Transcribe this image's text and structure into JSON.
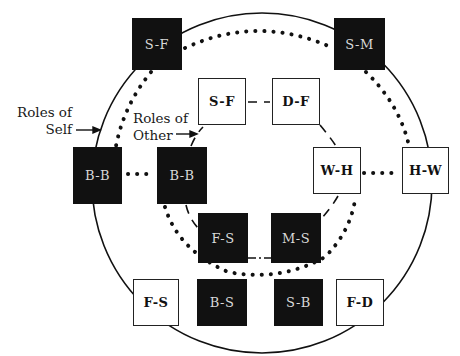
{
  "diagram": {
    "type": "role-relationship circle diagram",
    "colors": {
      "filled_box": "#111111",
      "open_box": "#ffffff",
      "line": "#111111"
    },
    "labels": {
      "self_line1": "Roles of",
      "self_line2": "Self",
      "other_line1": "Roles of",
      "other_line2": "Other"
    },
    "outer_ring": {
      "meaning": "Roles of Self",
      "nodes": [
        {
          "id": "outer-sf",
          "label": "S-F",
          "style": "filled"
        },
        {
          "id": "outer-sm",
          "label": "S-M",
          "style": "filled"
        },
        {
          "id": "outer-hw",
          "label": "H-W",
          "style": "open"
        },
        {
          "id": "outer-fd",
          "label": "F-D",
          "style": "open"
        },
        {
          "id": "outer-sb",
          "label": "S-B",
          "style": "filled"
        },
        {
          "id": "outer-bs",
          "label": "B-S",
          "style": "filled"
        },
        {
          "id": "outer-fs",
          "label": "F-S",
          "style": "open"
        },
        {
          "id": "outer-bb",
          "label": "B-B",
          "style": "filled"
        }
      ]
    },
    "inner_ring": {
      "meaning": "Roles of Other",
      "nodes": [
        {
          "id": "inner-sf",
          "label": "S-F",
          "style": "open"
        },
        {
          "id": "inner-df",
          "label": "D-F",
          "style": "open"
        },
        {
          "id": "inner-wh",
          "label": "W-H",
          "style": "open"
        },
        {
          "id": "inner-ms",
          "label": "M-S",
          "style": "filled"
        },
        {
          "id": "inner-fs",
          "label": "F-S",
          "style": "filled"
        },
        {
          "id": "inner-bb",
          "label": "B-B",
          "style": "filled"
        }
      ]
    },
    "connections": [
      {
        "type": "solid-circle",
        "description": "outer circle linking roles of self"
      },
      {
        "type": "dashed",
        "description": "inner ring linking roles of other"
      },
      {
        "type": "dotted",
        "from": "outer-sf",
        "to": "outer-sm"
      },
      {
        "type": "dotted",
        "from": "outer-sm",
        "to": "outer-hw"
      },
      {
        "type": "dotted",
        "from": "outer-sf",
        "to": "outer-bb"
      },
      {
        "type": "dotted",
        "from": "outer-bb",
        "to": "inner-bb"
      },
      {
        "type": "dotted",
        "from": "inner-wh",
        "to": "outer-hw"
      },
      {
        "type": "dotted",
        "from": "inner-bb",
        "to": "inner-fs"
      },
      {
        "type": "dotted",
        "from": "inner-fs",
        "to": "inner-ms"
      },
      {
        "type": "dotted",
        "from": "inner-ms",
        "to": "inner-wh"
      },
      {
        "type": "dash-dot",
        "from": "inner-fs",
        "to": "inner-ms"
      }
    ]
  }
}
